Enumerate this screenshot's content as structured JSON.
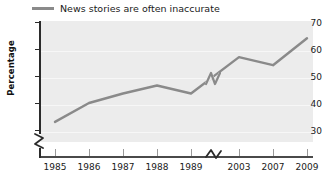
{
  "chart_data": {
    "type": "line",
    "title": "",
    "subtitle": "",
    "xlabel": "",
    "ylabel": "Percentage",
    "ylim": [
      27,
      70
    ],
    "yticks": [
      30,
      40,
      50,
      60,
      70
    ],
    "grid": true,
    "legend_position": "top-left",
    "axis_break_x": true,
    "axis_break_y": true,
    "axis_break_note": "x-axis break between 1989 and 2003; y-axis break below 30",
    "categories": [
      "1985",
      "1986",
      "1987",
      "1988",
      "1989",
      "2003",
      "2007",
      "2009"
    ],
    "series": [
      {
        "name": "News stories are often inaccurate",
        "color": "#8a8a8a",
        "values": [
          33,
          40,
          43.5,
          46.5,
          43.5,
          57,
          54,
          64
        ]
      }
    ],
    "x": [
      1985,
      1986,
      1987,
      1988,
      1989,
      2003,
      2007,
      2009
    ]
  },
  "legend": {
    "entries": [
      {
        "label": "News stories are often inaccurate",
        "color": "#8a8a8a"
      }
    ]
  },
  "axes": {
    "y": {
      "title": "Percentage",
      "ticks": [
        "70",
        "60",
        "50",
        "40",
        "30"
      ]
    },
    "x": {
      "ticks": [
        "1985",
        "1986",
        "1987",
        "1988",
        "1989",
        "2003",
        "2007",
        "2009"
      ]
    }
  },
  "colors": {
    "line": "#8a8a8a",
    "plot_background": "#ececec",
    "page_background": "#ffffff",
    "axis": "#2b2b2b",
    "gridline": "#f7f7f7",
    "text": "#1a1a1a"
  }
}
